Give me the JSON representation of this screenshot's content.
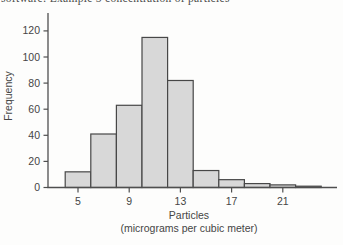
{
  "page": {
    "top_clipped_text": "software: Example 5 concentration of particles"
  },
  "chart_data": {
    "type": "bar",
    "chart_kind": "histogram",
    "title": "",
    "xlabel": "Particles",
    "xlabel_unit": "(micrograms per cubic meter)",
    "ylabel": "Frequency",
    "bin_start": 4,
    "bin_width": 2,
    "categories": [
      "4-6",
      "6-8",
      "8-10",
      "10-12",
      "12-14",
      "14-16",
      "16-18",
      "18-20",
      "20-22",
      "22-24"
    ],
    "values": [
      12,
      41,
      63,
      115,
      82,
      13,
      6,
      3,
      2,
      1
    ],
    "x_ticks": [
      5,
      9,
      13,
      17,
      21
    ],
    "y_ticks": [
      0,
      20,
      40,
      60,
      80,
      100,
      120
    ],
    "xlim": [
      3.2,
      24.6
    ],
    "ylim": [
      0,
      134
    ],
    "grid": false,
    "legend": "none",
    "bar_fill": "#d8d8d8",
    "bar_stroke": "#474747",
    "axis_color": "#4f4f4f",
    "text_color": "#454545"
  }
}
